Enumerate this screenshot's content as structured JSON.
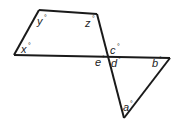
{
  "diagram": {
    "type": "geometry-angles",
    "stroke_color": "#1a1a1a",
    "labels": {
      "x": "x",
      "y": "y",
      "z": "z",
      "c": "c",
      "d": "d",
      "e": "e",
      "b": "b",
      "a": "a"
    },
    "degree_symbol": "°",
    "vertices": {
      "top_left": [
        39,
        10
      ],
      "top_right": [
        97,
        14
      ],
      "left": [
        14,
        55
      ],
      "intersection": [
        107,
        56
      ],
      "right": [
        170,
        58
      ],
      "bottom": [
        124,
        118
      ]
    }
  }
}
